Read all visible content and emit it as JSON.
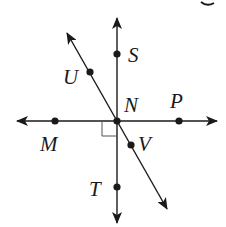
{
  "diagram": {
    "type": "geometry-lines",
    "colors": {
      "stroke": "#1a1a1a",
      "background": "#ffffff"
    },
    "points": [
      {
        "name": "S",
        "label": "S",
        "x": 117,
        "y": 54
      },
      {
        "name": "U",
        "label": "U",
        "x": 90,
        "y": 72
      },
      {
        "name": "N",
        "label": "N",
        "x": 117,
        "y": 121
      },
      {
        "name": "P",
        "label": "P",
        "x": 179,
        "y": 121
      },
      {
        "name": "M",
        "label": "M",
        "x": 55,
        "y": 121
      },
      {
        "name": "V",
        "label": "V",
        "x": 131,
        "y": 145
      },
      {
        "name": "T",
        "label": "T",
        "x": 117,
        "y": 187
      }
    ],
    "lines": [
      {
        "name": "line-MP",
        "through": [
          "M",
          "N",
          "P"
        ],
        "orientation": "horizontal"
      },
      {
        "name": "line-ST",
        "through": [
          "S",
          "N",
          "T"
        ],
        "orientation": "vertical"
      },
      {
        "name": "line-UV",
        "through": [
          "U",
          "N",
          "V"
        ],
        "orientation": "diagonal"
      }
    ],
    "right_angle_at": "N",
    "labels": {
      "S": "S",
      "U": "U",
      "N": "N",
      "P": "P",
      "M": "M",
      "V": "V",
      "T": "T"
    },
    "partial_glyph_top_right": "g"
  }
}
